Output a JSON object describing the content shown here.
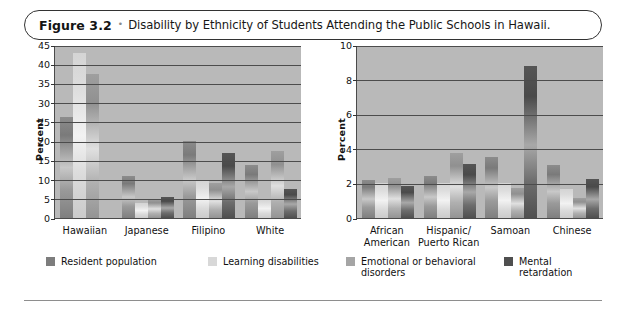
{
  "figure": {
    "number": "Figure 3.2",
    "separator": "•",
    "caption": "Disability by Ethnicity of Students Attending the Public Schools in Hawaii."
  },
  "legend": {
    "items": [
      {
        "label": "Resident population",
        "color": "#7d7d7d"
      },
      {
        "label": "Learning disabilities",
        "color": "#d8d8d8"
      },
      {
        "label": "Emotional or behavioral\ndisorders",
        "color": "#a5a5a5"
      },
      {
        "label": "Mental retardation",
        "color": "#4f4f4f"
      }
    ]
  },
  "chart_data": [
    {
      "id": "left",
      "type": "bar",
      "title": "",
      "xlabel": "",
      "ylabel": "Percent",
      "ylim": [
        0,
        45
      ],
      "yticks": [
        0,
        5,
        10,
        15,
        20,
        25,
        30,
        35,
        40,
        45
      ],
      "grid": true,
      "legend_position": "below",
      "categories": [
        "Hawaiian",
        "Japanese",
        "Filipino",
        "White"
      ],
      "series": [
        {
          "name": "Resident population",
          "values": [
            26.2,
            11.0,
            20.0,
            13.7
          ]
        },
        {
          "name": "Learning disabilities",
          "values": [
            42.8,
            4.0,
            10.0,
            5.0
          ]
        },
        {
          "name": "Emotional or behavioral disorders",
          "values": [
            37.5,
            5.0,
            9.0,
            17.5
          ]
        },
        {
          "name": "Mental retardation",
          "values": [
            0.0,
            5.4,
            16.8,
            7.5
          ]
        }
      ]
    },
    {
      "id": "right",
      "type": "bar",
      "title": "",
      "xlabel": "",
      "ylabel": "Percent",
      "ylim": [
        0,
        10
      ],
      "yticks": [
        0,
        2,
        4,
        6,
        8,
        10
      ],
      "grid": true,
      "legend_position": "below",
      "categories": [
        "African\nAmerican",
        "Hispanic/\nPuerto Rican",
        "Samoan",
        "Chinese"
      ],
      "series": [
        {
          "name": "Resident population",
          "values": [
            2.2,
            2.45,
            3.5,
            3.05
          ]
        },
        {
          "name": "Learning disabilities",
          "values": [
            2.0,
            2.0,
            2.0,
            1.65
          ]
        },
        {
          "name": "Emotional or behavioral disorders",
          "values": [
            2.3,
            3.75,
            1.75,
            1.15
          ]
        },
        {
          "name": "Mental retardation",
          "values": [
            1.85,
            3.1,
            8.8,
            2.25
          ]
        }
      ]
    }
  ]
}
